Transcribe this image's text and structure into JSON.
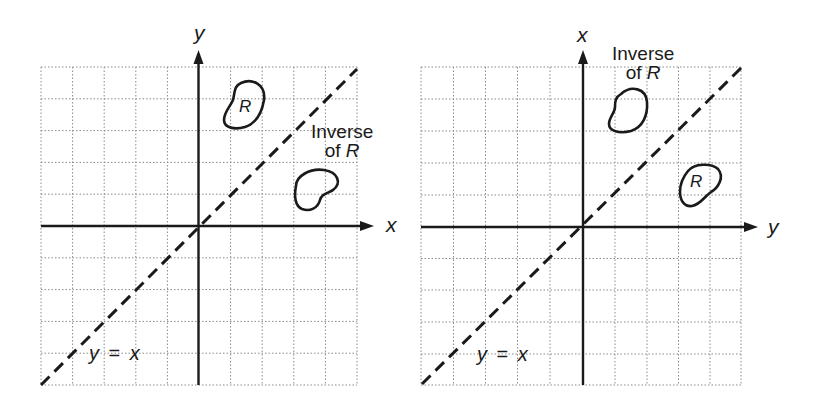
{
  "figure": {
    "colors": {
      "ink": "#1a1a1a",
      "grid": "#8a8a8a",
      "background": "#ffffff"
    }
  },
  "left_panel": {
    "horizontal_axis_label": "x",
    "vertical_axis_label": "y",
    "line_label": {
      "lhs": "y",
      "eq": "=",
      "rhs": "x"
    },
    "region_label": "R",
    "inverse_label": {
      "line1": "Inverse",
      "line2_prefix": "of",
      "line2_var": "R"
    },
    "grid": {
      "columns": 10,
      "rows": 10,
      "origin_col": 5,
      "origin_row": 5
    }
  },
  "right_panel": {
    "horizontal_axis_label": "y",
    "vertical_axis_label": "x",
    "line_label": {
      "lhs": "y",
      "eq": "=",
      "rhs": "x"
    },
    "region_label": "R",
    "inverse_label": {
      "line1": "Inverse",
      "line2_prefix": "of",
      "line2_var": "R"
    },
    "grid": {
      "columns": 10,
      "rows": 10,
      "origin_col": 5,
      "origin_row": 5
    }
  }
}
